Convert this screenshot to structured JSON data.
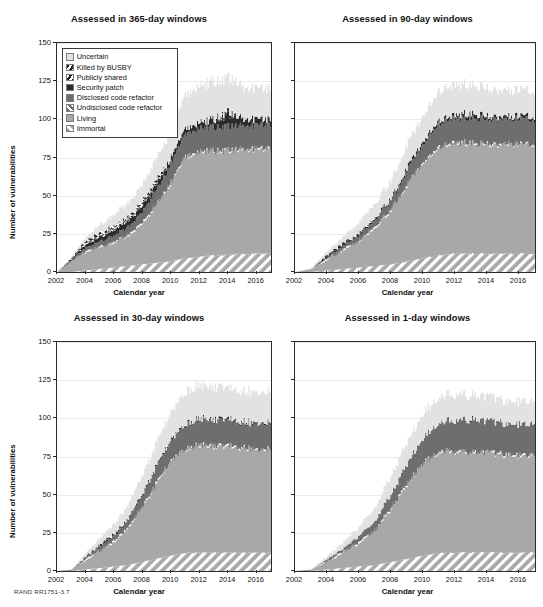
{
  "figure": {
    "footnote": "RAND RR1751-3.7",
    "axis_x_title": "Calendar year",
    "axis_y_title": "Number of vulnerabilities"
  },
  "legend": {
    "items": [
      {
        "label": "Uncertain",
        "pattern": "solid",
        "color": "#e2e2e2"
      },
      {
        "label": "Killed by BUSBY",
        "pattern": "hatch-dark-steep",
        "color": "#1d1d1d"
      },
      {
        "label": "Publicly shared",
        "pattern": "hatch-white-steep",
        "color": "#ffffff"
      },
      {
        "label": "Security patch",
        "pattern": "solid",
        "color": "#2b2b2b"
      },
      {
        "label": "Disclosed code refactor",
        "pattern": "solid",
        "color": "#6e6e6e"
      },
      {
        "label": "Undisclosed code refactor",
        "pattern": "hatch-white-on-dark",
        "color": "#6e6e6e"
      },
      {
        "label": "Living",
        "pattern": "solid",
        "color": "#a8a8a8"
      },
      {
        "label": "Immortal",
        "pattern": "hatch-white-on-gray",
        "color": "#a8a8a8"
      }
    ]
  },
  "chart_data": [
    {
      "type": "area",
      "id": "panel-365",
      "title": "Assessed in 365-day windows",
      "xlabel": "Calendar year",
      "ylabel": "Number of vulnerabilities",
      "xlim": [
        2002,
        2017
      ],
      "ylim": [
        0,
        150
      ],
      "yticks": [
        0,
        25,
        50,
        75,
        100,
        125,
        150
      ],
      "xticks": [
        2002,
        2004,
        2006,
        2008,
        2010,
        2012,
        2014,
        2016
      ],
      "grid": true,
      "legend_position": "upper left",
      "x": [
        2002,
        2003,
        2004,
        2005,
        2006,
        2007,
        2008,
        2009,
        2010,
        2011,
        2012,
        2013,
        2014,
        2015,
        2016,
        2017
      ],
      "series": [
        {
          "name": "Immortal",
          "values": [
            0,
            0,
            1,
            2,
            3,
            4,
            5,
            6,
            7,
            9,
            10,
            11,
            11,
            12,
            12,
            12
          ]
        },
        {
          "name": "Living",
          "values": [
            0,
            7,
            12,
            14,
            16,
            20,
            27,
            38,
            52,
            66,
            68,
            68,
            68,
            68,
            68,
            68
          ]
        },
        {
          "name": "Undisclosed code refactor",
          "values": [
            0,
            0,
            1,
            1,
            1,
            1,
            1,
            1,
            1,
            1,
            1,
            1,
            1,
            1,
            1,
            1
          ]
        },
        {
          "name": "Disclosed code refactor",
          "values": [
            0,
            1,
            2,
            3,
            4,
            5,
            7,
            9,
            12,
            14,
            15,
            15,
            15,
            15,
            15,
            15
          ]
        },
        {
          "name": "Security patch",
          "values": [
            0,
            1,
            2,
            3,
            4,
            4,
            4,
            4,
            4,
            4,
            4,
            5,
            8,
            5,
            4,
            4
          ]
        },
        {
          "name": "Publicly shared",
          "values": [
            0,
            0,
            1,
            1,
            1,
            1,
            1,
            1,
            0,
            0,
            0,
            0,
            0,
            0,
            0,
            0
          ]
        },
        {
          "name": "Killed by BUSBY",
          "values": [
            0,
            0,
            2,
            2,
            2,
            2,
            2,
            2,
            0,
            0,
            0,
            1,
            2,
            0,
            0,
            0
          ]
        },
        {
          "name": "Uncertain",
          "values": [
            0,
            1,
            2,
            5,
            7,
            9,
            11,
            14,
            18,
            22,
            24,
            24,
            22,
            21,
            20,
            20
          ]
        }
      ],
      "totals": [
        0,
        10,
        23,
        31,
        38,
        46,
        58,
        75,
        94,
        116,
        122,
        125,
        127,
        122,
        120,
        120
      ]
    },
    {
      "type": "area",
      "id": "panel-90",
      "title": "Assessed in 90-day windows",
      "xlabel": "Calendar year",
      "ylabel": "Number of vulnerabilities",
      "xlim": [
        2002,
        2017
      ],
      "ylim": [
        0,
        150
      ],
      "yticks": [
        0,
        25,
        50,
        75,
        100,
        125,
        150
      ],
      "xticks": [
        2002,
        2004,
        2006,
        2008,
        2010,
        2012,
        2014,
        2016
      ],
      "grid": true,
      "legend_position": "none",
      "x": [
        2002,
        2003,
        2004,
        2005,
        2006,
        2007,
        2008,
        2009,
        2010,
        2011,
        2012,
        2013,
        2014,
        2015,
        2016,
        2017
      ],
      "series": [
        {
          "name": "Immortal",
          "values": [
            0,
            0,
            1,
            2,
            3,
            4,
            5,
            7,
            9,
            11,
            12,
            12,
            12,
            12,
            12,
            12
          ]
        },
        {
          "name": "Living",
          "values": [
            0,
            2,
            7,
            12,
            17,
            25,
            36,
            50,
            62,
            70,
            72,
            72,
            71,
            71,
            71,
            71
          ]
        },
        {
          "name": "Undisclosed code refactor",
          "values": [
            0,
            0,
            1,
            1,
            1,
            1,
            1,
            1,
            1,
            1,
            1,
            1,
            1,
            1,
            1,
            1
          ]
        },
        {
          "name": "Disclosed code refactor",
          "values": [
            0,
            0,
            1,
            2,
            3,
            4,
            6,
            9,
            12,
            15,
            16,
            16,
            16,
            16,
            16,
            16
          ]
        },
        {
          "name": "Security patch",
          "values": [
            0,
            0,
            1,
            1,
            1,
            1,
            1,
            2,
            2,
            2,
            2,
            3,
            2,
            2,
            2,
            2
          ]
        },
        {
          "name": "Publicly shared",
          "values": [
            0,
            0,
            0,
            0,
            0,
            0,
            0,
            0,
            0,
            0,
            0,
            0,
            0,
            0,
            0,
            0
          ]
        },
        {
          "name": "Killed by BUSBY",
          "values": [
            0,
            0,
            1,
            1,
            1,
            1,
            0,
            0,
            0,
            0,
            0,
            0,
            0,
            0,
            0,
            0
          ]
        },
        {
          "name": "Uncertain",
          "values": [
            0,
            1,
            2,
            4,
            7,
            9,
            12,
            15,
            17,
            19,
            20,
            19,
            18,
            17,
            17,
            17
          ]
        }
      ],
      "totals": [
        0,
        3,
        14,
        23,
        33,
        45,
        61,
        84,
        103,
        118,
        123,
        123,
        120,
        119,
        119,
        119
      ]
    },
    {
      "type": "area",
      "id": "panel-30",
      "title": "Assessed in 30-day windows",
      "xlabel": "Calendar year",
      "ylabel": "Number of vulnerabilities",
      "xlim": [
        2002,
        2017
      ],
      "ylim": [
        0,
        150
      ],
      "yticks": [
        0,
        25,
        50,
        75,
        100,
        125,
        150
      ],
      "xticks": [
        2002,
        2004,
        2006,
        2008,
        2010,
        2012,
        2014,
        2016
      ],
      "grid": true,
      "legend_position": "none",
      "x": [
        2002,
        2003,
        2004,
        2005,
        2006,
        2007,
        2008,
        2009,
        2010,
        2011,
        2012,
        2013,
        2014,
        2015,
        2016,
        2017
      ],
      "series": [
        {
          "name": "Immortal",
          "values": [
            0,
            0,
            1,
            2,
            3,
            4,
            6,
            8,
            10,
            12,
            12,
            12,
            12,
            12,
            12,
            12
          ]
        },
        {
          "name": "Living",
          "values": [
            0,
            1,
            6,
            11,
            16,
            24,
            36,
            50,
            62,
            68,
            70,
            69,
            69,
            68,
            67,
            67
          ]
        },
        {
          "name": "Undisclosed code refactor",
          "values": [
            0,
            0,
            1,
            1,
            1,
            1,
            1,
            1,
            1,
            1,
            1,
            1,
            1,
            1,
            1,
            1
          ]
        },
        {
          "name": "Disclosed code refactor",
          "values": [
            0,
            0,
            1,
            2,
            3,
            5,
            7,
            10,
            13,
            15,
            16,
            16,
            16,
            16,
            16,
            16
          ]
        },
        {
          "name": "Security patch",
          "values": [
            0,
            0,
            0,
            1,
            1,
            1,
            1,
            1,
            1,
            1,
            1,
            1,
            1,
            1,
            1,
            1
          ]
        },
        {
          "name": "Publicly shared",
          "values": [
            0,
            0,
            0,
            0,
            0,
            0,
            0,
            0,
            0,
            0,
            0,
            0,
            0,
            0,
            0,
            0
          ]
        },
        {
          "name": "Killed by BUSBY",
          "values": [
            0,
            0,
            1,
            1,
            1,
            0,
            0,
            0,
            0,
            0,
            0,
            0,
            0,
            0,
            0,
            0
          ]
        },
        {
          "name": "Uncertain",
          "values": [
            0,
            0,
            2,
            4,
            6,
            9,
            12,
            15,
            18,
            21,
            22,
            21,
            20,
            20,
            20,
            20
          ]
        }
      ],
      "totals": [
        0,
        1,
        12,
        22,
        31,
        44,
        63,
        85,
        105,
        118,
        122,
        120,
        119,
        118,
        117,
        117
      ]
    },
    {
      "type": "area",
      "id": "panel-1",
      "title": "Assessed in 1-day windows",
      "xlabel": "Calendar year",
      "ylabel": "Number of vulnerabilities",
      "xlim": [
        2002,
        2017
      ],
      "ylim": [
        0,
        150
      ],
      "yticks": [
        0,
        25,
        50,
        75,
        100,
        125,
        150
      ],
      "xticks": [
        2002,
        2004,
        2006,
        2008,
        2010,
        2012,
        2014,
        2016
      ],
      "grid": true,
      "legend_position": "none",
      "x": [
        2002,
        2003,
        2004,
        2005,
        2006,
        2007,
        2008,
        2009,
        2010,
        2011,
        2012,
        2013,
        2014,
        2015,
        2016,
        2017
      ],
      "series": [
        {
          "name": "Immortal",
          "values": [
            0,
            0,
            1,
            2,
            3,
            4,
            6,
            8,
            10,
            12,
            12,
            12,
            12,
            12,
            12,
            12
          ]
        },
        {
          "name": "Living",
          "values": [
            0,
            1,
            5,
            10,
            15,
            23,
            35,
            49,
            60,
            66,
            66,
            65,
            65,
            64,
            63,
            63
          ]
        },
        {
          "name": "Undisclosed code refactor",
          "values": [
            0,
            0,
            1,
            1,
            1,
            1,
            1,
            1,
            1,
            1,
            1,
            1,
            1,
            1,
            1,
            1
          ]
        },
        {
          "name": "Disclosed code refactor",
          "values": [
            0,
            0,
            1,
            2,
            4,
            6,
            9,
            13,
            16,
            19,
            20,
            20,
            20,
            20,
            20,
            20
          ]
        },
        {
          "name": "Security patch",
          "values": [
            0,
            0,
            0,
            0,
            0,
            0,
            0,
            0,
            0,
            0,
            0,
            1,
            0,
            0,
            0,
            0
          ]
        },
        {
          "name": "Publicly shared",
          "values": [
            0,
            0,
            0,
            0,
            0,
            0,
            0,
            0,
            0,
            0,
            0,
            0,
            0,
            0,
            0,
            0
          ]
        },
        {
          "name": "Killed by BUSBY",
          "values": [
            0,
            0,
            0,
            0,
            0,
            0,
            0,
            0,
            0,
            0,
            0,
            0,
            0,
            0,
            0,
            0
          ]
        },
        {
          "name": "Uncertain",
          "values": [
            0,
            0,
            2,
            4,
            6,
            9,
            12,
            14,
            16,
            17,
            17,
            16,
            16,
            15,
            15,
            15
          ]
        }
      ],
      "totals": [
        0,
        1,
        10,
        19,
        29,
        43,
        63,
        85,
        103,
        115,
        116,
        115,
        114,
        112,
        111,
        111
      ]
    }
  ]
}
